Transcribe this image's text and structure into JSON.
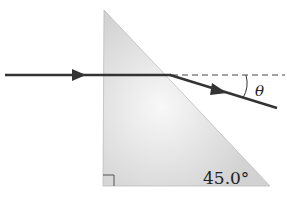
{
  "diagram": {
    "prism": {
      "shape": "right triangle",
      "vertices": {
        "top": [
          104,
          10
        ],
        "bottom_left": [
          103,
          186
        ],
        "bottom_right": [
          270,
          186
        ]
      },
      "right_angle_marker": "bottom-left",
      "fill_color": "#d9d9d9",
      "angle_label": "45.0°"
    },
    "ray": {
      "incident": {
        "from": [
          5,
          75
        ],
        "to": [
          170,
          75
        ],
        "arrow_at": [
          80,
          75
        ]
      },
      "refracted": {
        "from": [
          170,
          75
        ],
        "to": [
          277,
          108
        ],
        "arrow_at": [
          222,
          91
        ]
      },
      "color": "#333333"
    },
    "normal_extension": {
      "style": "dashed",
      "from": [
        170,
        75
      ],
      "to": [
        285,
        75
      ]
    },
    "angle_symbol": "θ"
  }
}
